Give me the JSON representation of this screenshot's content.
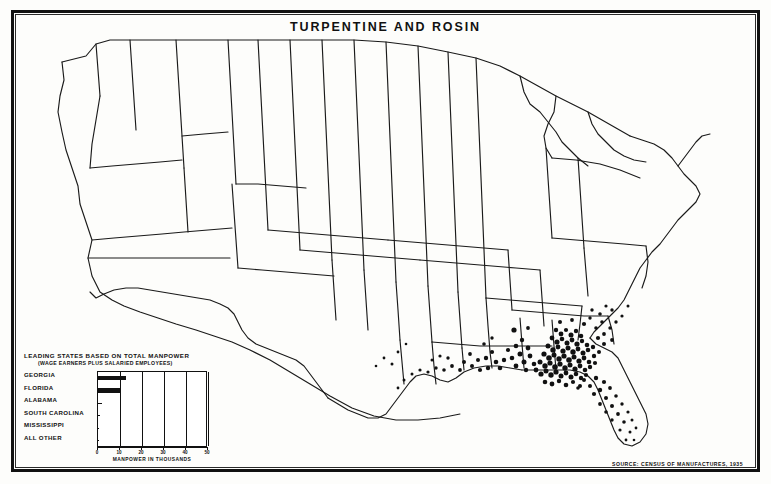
{
  "title": "TURPENTINE AND ROSIN",
  "source_credit": "SOURCE: CENSUS OF MANUFACTURES, 1935",
  "legend": {
    "title": "LEADING STATES BASED ON TOTAL MANPOWER",
    "subtitle": "(WAGE EARNERS PLUS SALARIED EMPLOYEES)"
  },
  "chart_data": {
    "type": "bar",
    "title": "LEADING STATES BASED ON TOTAL MANPOWER",
    "subtitle": "(WAGE EARNERS PLUS SALARIED EMPLOYEES)",
    "orientation": "horizontal",
    "categories": [
      "GEORGIA",
      "FLORIDA",
      "ALABAMA",
      "SOUTH CAROLINA",
      "MISSISSIPPI",
      "ALL OTHER"
    ],
    "values": [
      12.5,
      10.0,
      2.0,
      0.7,
      0.5,
      0.6
    ],
    "xlabel": "MANPOWER IN THOUSANDS",
    "ylabel": "",
    "xlim": [
      0,
      50
    ],
    "xticks": [
      0,
      10,
      20,
      30,
      40,
      50
    ],
    "xticklabels": [
      "0",
      "10",
      "20",
      "30",
      "40",
      "50"
    ],
    "grid": true,
    "legend_position": "none"
  },
  "map": {
    "description": "Dot distribution map of the United States showing turpentine and rosin establishments concentrated in the southeastern pine belt",
    "dot_symbol_meaning": "establishment location"
  }
}
